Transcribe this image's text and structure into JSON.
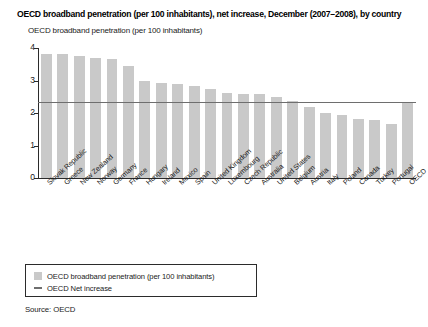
{
  "figure": {
    "title": "OECD broadband penetration (per 100 inhabitants), net increase, December (2007–2008), by country",
    "axis_caption": "OECD broadband penetration (per 100 inhabitants)",
    "source": "Source: OECD"
  },
  "legend": {
    "position": "below-plot",
    "items": [
      {
        "marker": "bar-swatch",
        "label": "OECD broadband penetration (per 100 inhabitants)",
        "color": "#c9c9c9"
      },
      {
        "marker": "line-dash",
        "label": "OECD Net increase",
        "color": "#6e6e6e"
      }
    ]
  },
  "chart_data": {
    "type": "bar",
    "title": "OECD broadband penetration (per 100 inhabitants), net increase, December (2007–2008), by country",
    "xlabel": "",
    "ylabel": "OECD broadband penetration (per 100 inhabitants)",
    "ylim": [
      0,
      4
    ],
    "yticks": [
      0,
      1,
      2,
      3,
      4
    ],
    "ytick_labels": [
      "0",
      "1",
      "2",
      "3",
      "4"
    ],
    "grid": false,
    "categories": [
      "Slovak Republic",
      "Greece",
      "New Zealand",
      "Norway",
      "Germany",
      "France",
      "Hungary",
      "Ireland",
      "Mexico",
      "Spain",
      "United Kingdom",
      "Luxembourg",
      "Czech Republic",
      "Australia",
      "United States",
      "Belgium",
      "Austria",
      "Italy",
      "Poland",
      "Canada",
      "Turkey",
      "Portugal",
      "OECD"
    ],
    "values": [
      3.82,
      3.81,
      3.76,
      3.68,
      3.65,
      3.44,
      2.98,
      2.93,
      2.88,
      2.84,
      2.74,
      2.62,
      2.6,
      2.58,
      2.5,
      2.38,
      2.18,
      2.0,
      1.93,
      1.83,
      1.8,
      1.67,
      2.35
    ],
    "series_name": "OECD broadband penetration (per 100 inhabitants)",
    "bar_color": "#c9c9c9",
    "reference_line": {
      "name": "OECD Net increase",
      "value": 2.35,
      "color": "#6e6e6e"
    }
  }
}
